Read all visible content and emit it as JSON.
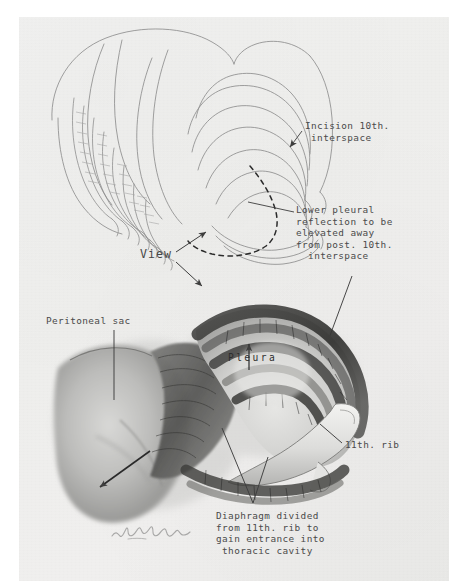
{
  "document": {
    "type": "medical-illustration",
    "medium": "pencil and charcoal drawing on paper",
    "subject": "Surgical approach through the 10th interspace showing pleural reflection and diaphragm division from the 11th rib",
    "signature": "L. Schlossberg"
  },
  "figures": {
    "upper": {
      "name": "posterior rib cage with planned incision",
      "description": "Outline drawing of the lower thoracic cage seen from behind, with a dashed curve marking the pleural reflection"
    },
    "lower": {
      "name": "operative field detail",
      "description": "Tonal charcoal rendering of the pleural dome, 11th rib and peritoneal sac"
    }
  },
  "labels": {
    "incision": {
      "lines": [
        "Incision 10th.",
        " interspace"
      ],
      "text": "Incision 10th. interspace"
    },
    "lower_pleural": {
      "lines": [
        "Lower pleural",
        "reflection to be",
        "elevated away",
        "from post. 10th.",
        "  interspace"
      ],
      "text": "Lower pleural reflection to be elevated away from post. 10th. interspace"
    },
    "view": {
      "text": "View"
    },
    "peritoneal_sac": {
      "text": "Peritoneal sac"
    },
    "pleura": {
      "text": "Pleura"
    },
    "rib_11": {
      "text": "11th. rib"
    },
    "diaphragm": {
      "lines": [
        "Diaphragm divided",
        "from 11th. rib to",
        "gain entrance into",
        " thoracic cavity"
      ],
      "text": "Diaphragm divided from 11th. rib to gain entrance into thoracic cavity"
    }
  },
  "colors": {
    "paper": "#efefed",
    "ink": "#4a4a4a",
    "pencil": "#8a8a8a",
    "charcoal": "#3a3a3a",
    "page_background": "#ffffff"
  }
}
